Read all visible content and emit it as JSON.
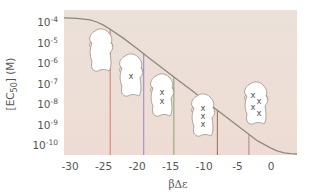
{
  "chart_data": {
    "type": "line",
    "title": "",
    "xlabel": "βΔε",
    "ylabel": "[EC50] (M)",
    "xlim": [
      -31,
      4
    ],
    "ylim_log10": [
      -10.5,
      -3.6
    ],
    "y_scale": "log",
    "grid": false,
    "x_ticks": [
      -30,
      -25,
      -20,
      -15,
      -10,
      -5,
      0
    ],
    "x_tick_labels": [
      "-30",
      "-25",
      "-20",
      "-15",
      "-10",
      "-5",
      "0"
    ],
    "y_ticks_log10": [
      -4,
      -5,
      -6,
      -7,
      -8,
      -9,
      -10
    ],
    "y_tick_labels": [
      {
        "base": "10",
        "exp": "-4"
      },
      {
        "base": "10",
        "exp": "-5"
      },
      {
        "base": "10",
        "exp": "-6"
      },
      {
        "base": "10",
        "exp": "-7"
      },
      {
        "base": "10",
        "exp": "-8"
      },
      {
        "base": "10",
        "exp": "-9"
      },
      {
        "base": "10",
        "exp": "-10"
      }
    ],
    "series": [
      {
        "name": "EC50 curve",
        "color": "#8a8a80",
        "x": [
          -31,
          -29,
          -27,
          -26,
          -25,
          -24,
          -22,
          -20,
          -18,
          -16,
          -14,
          -12,
          -10,
          -8,
          -6,
          -4,
          -2,
          0,
          1,
          2,
          3,
          4
        ],
        "log10_y": [
          -3.8,
          -3.82,
          -3.9,
          -4.0,
          -4.15,
          -4.35,
          -4.8,
          -5.3,
          -5.8,
          -6.3,
          -6.8,
          -7.3,
          -7.8,
          -8.3,
          -8.8,
          -9.3,
          -9.8,
          -10.15,
          -10.3,
          -10.38,
          -10.42,
          -10.44
        ]
      }
    ],
    "vertical_lines": [
      {
        "x": -24,
        "color": "#d9836a",
        "label": "0 mutations"
      },
      {
        "x": -19,
        "color": "#9a8fc6",
        "label": "1 mutation"
      },
      {
        "x": -14.5,
        "color": "#93a877",
        "label": "2 mutations"
      },
      {
        "x": -8,
        "color": "#a0736a",
        "label": "3 mutations"
      },
      {
        "x": -3.3,
        "color": "#b88a96",
        "label": "4 mutations"
      }
    ],
    "annotations": [
      {
        "type": "protein-blob",
        "marks": 0,
        "mark_glyph": "x"
      },
      {
        "type": "protein-blob",
        "marks": 1,
        "mark_glyph": "x"
      },
      {
        "type": "protein-blob",
        "marks": 2,
        "mark_glyph": "x"
      },
      {
        "type": "protein-blob",
        "marks": 3,
        "mark_glyph": "x"
      },
      {
        "type": "protein-blob",
        "marks": 4,
        "mark_glyph": "x"
      }
    ],
    "background_color": "#ece0d8"
  },
  "labels": {
    "ylabel_main": "[EC",
    "ylabel_sub": "50",
    "ylabel_end": "] (M)",
    "xlabel": "βΔε",
    "mark": "x"
  }
}
